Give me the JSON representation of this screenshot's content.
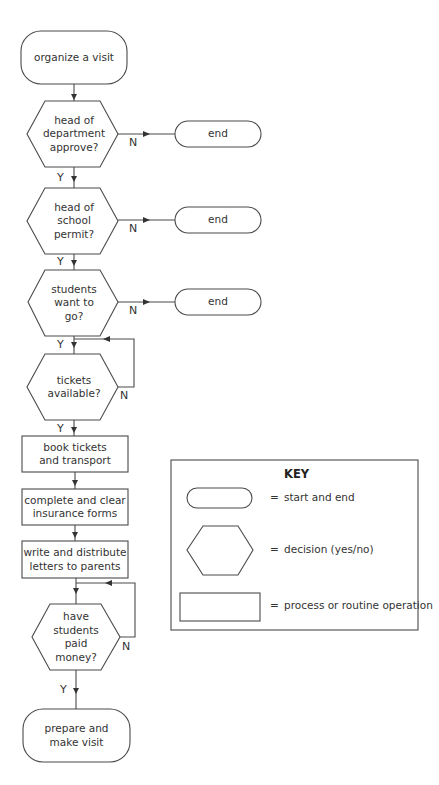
{
  "flowchart": {
    "start": {
      "label": "organize a visit"
    },
    "decisions": [
      {
        "label": "head of\ndepartment\napprove?",
        "yes": "Y",
        "no": "N",
        "no_target": "end"
      },
      {
        "label": "head of\nschool\npermit?",
        "yes": "Y",
        "no": "N",
        "no_target": "end"
      },
      {
        "label": "students\nwant to\ngo?",
        "yes": "Y",
        "no": "N",
        "no_target": "end"
      },
      {
        "label": "tickets\navailable?",
        "yes": "Y",
        "no": "N",
        "no_target": "loop back"
      }
    ],
    "processes": [
      {
        "label": "book tickets\nand transport"
      },
      {
        "label": "complete and clear\ninsurance forms"
      },
      {
        "label": "write and distribute\nletters to parents"
      }
    ],
    "final_decision": {
      "label": "have\nstudents\npaid\nmoney?",
      "yes": "Y",
      "no": "N"
    },
    "ends": [
      {
        "label": "end"
      },
      {
        "label": "end"
      },
      {
        "label": "end"
      }
    ],
    "finish": {
      "label": "prepare and\nmake visit"
    }
  },
  "key": {
    "title": "KEY",
    "items": [
      {
        "shape": "rounded-rectangle",
        "eq": "=",
        "label": "start and end"
      },
      {
        "shape": "hexagon",
        "eq": "=",
        "label": "decision (yes/no)"
      },
      {
        "shape": "rectangle",
        "eq": "=",
        "label": "process or routine operation"
      }
    ]
  }
}
